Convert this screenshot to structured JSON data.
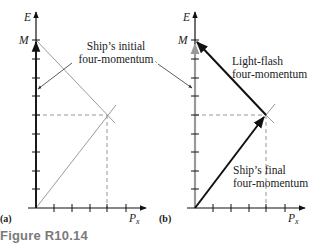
{
  "figure": {
    "caption": "Figure R10.14",
    "panels": [
      {
        "tag": "(a)",
        "axes": {
          "y_label": "E",
          "x_label": "P",
          "x_subscript": "x",
          "y_mark": "M"
        },
        "annotations": {
          "line1": "Ship’s initial",
          "line2": "four-momentum"
        }
      },
      {
        "tag": "(b)",
        "axes": {
          "y_label": "E",
          "x_label": "P",
          "x_subscript": "x",
          "y_mark": "M"
        },
        "annotations": {
          "light_line1": "Light-flash",
          "light_line2": "four-momentum",
          "final_line1": "Ship’s final",
          "final_line2": "four-momentum"
        }
      }
    ]
  },
  "colors": {
    "axis": "#111111",
    "gray_line": "#999999",
    "dashed": "#8a8a8a",
    "caption": "#7a7a7a"
  }
}
